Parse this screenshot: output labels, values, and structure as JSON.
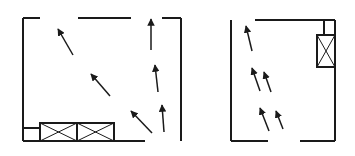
{
  "figure": {
    "stroke_color": "#1a1a1a",
    "background": "#ffffff"
  },
  "diagrams": [
    {
      "name": "left-room",
      "walls": [
        [
          23,
          18,
          23,
          141
        ],
        [
          23,
          18,
          40,
          18
        ],
        [
          78,
          18,
          131,
          18
        ],
        [
          162,
          18,
          181,
          18
        ],
        [
          181,
          18,
          181,
          141
        ],
        [
          23,
          141,
          145,
          141
        ],
        [
          23,
          128,
          40,
          128
        ]
      ],
      "units": [
        {
          "x": 40,
          "y": 123,
          "w": 37,
          "h": 18
        },
        {
          "x": 77,
          "y": 123,
          "w": 37,
          "h": 18
        }
      ],
      "arrows": [
        [
          73,
          55,
          58,
          29
        ],
        [
          110,
          96,
          91,
          74
        ],
        [
          152,
          133,
          131,
          111
        ],
        [
          151,
          50,
          151,
          19
        ],
        [
          158,
          92,
          155,
          65
        ],
        [
          164,
          132,
          162,
          105
        ]
      ]
    },
    {
      "name": "right-room",
      "walls": [
        [
          231,
          20,
          231,
          141
        ],
        [
          255,
          20,
          335,
          20
        ],
        [
          335,
          20,
          335,
          141
        ],
        [
          231,
          141,
          268,
          141
        ],
        [
          300,
          141,
          335,
          141
        ],
        [
          324,
          20,
          324,
          35
        ]
      ],
      "units": [
        {
          "x": 317,
          "y": 35,
          "w": 18,
          "h": 32
        }
      ],
      "arrows": [
        [
          252,
          51,
          246,
          26
        ],
        [
          260,
          91,
          252,
          68
        ],
        [
          271,
          92,
          264,
          72
        ],
        [
          269,
          131,
          260,
          108
        ],
        [
          283,
          129,
          276,
          111
        ]
      ]
    }
  ]
}
